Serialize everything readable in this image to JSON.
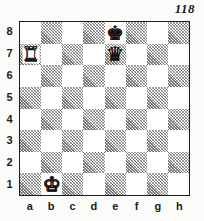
{
  "diagram": {
    "number": "118",
    "type": "chess-position-diagram"
  },
  "board": {
    "files": [
      "a",
      "b",
      "c",
      "d",
      "e",
      "f",
      "g",
      "h"
    ],
    "ranks": [
      "8",
      "7",
      "6",
      "5",
      "4",
      "3",
      "2",
      "1"
    ],
    "light_square_color": "#ffffff",
    "dark_square_color": "#c9c9c9",
    "border_color": "#1d1d1f",
    "orientation": "white-bottom",
    "pieces": [
      {
        "square": "a7",
        "color": "white",
        "type": "rook",
        "glyph": "♜",
        "name": "white-rook-a7"
      },
      {
        "square": "e8",
        "color": "black",
        "type": "king",
        "glyph": "♚",
        "name": "black-king-e8"
      },
      {
        "square": "e7",
        "color": "black",
        "type": "queen",
        "glyph": "♛",
        "name": "black-queen-e7"
      },
      {
        "square": "b1",
        "color": "white",
        "type": "king",
        "glyph": "♚",
        "name": "white-king-b1"
      }
    ]
  }
}
